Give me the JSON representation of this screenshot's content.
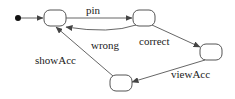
{
  "diagram": {
    "type": "state-machine",
    "initial": {
      "x": 18,
      "y": 18
    },
    "states": [
      {
        "id": "s1",
        "x": 44,
        "y": 10,
        "w": 22,
        "h": 16
      },
      {
        "id": "s2",
        "x": 133,
        "y": 10,
        "w": 22,
        "h": 16
      },
      {
        "id": "s3",
        "x": 200,
        "y": 44,
        "w": 22,
        "h": 16
      },
      {
        "id": "s4",
        "x": 110,
        "y": 75,
        "w": 22,
        "h": 16
      }
    ],
    "transitions": [
      {
        "from": "s1",
        "to": "s2",
        "label": "pin"
      },
      {
        "from": "s2",
        "to": "s1",
        "label": "wrong"
      },
      {
        "from": "s2",
        "to": "s3",
        "label": "correct"
      },
      {
        "from": "s3",
        "to": "s4",
        "label": "viewAcc"
      },
      {
        "from": "s4",
        "to": "s1",
        "label": "showAcc"
      }
    ]
  },
  "labels": {
    "pin": "pin",
    "wrong": "wrong",
    "correct": "correct",
    "viewAcc": "viewAcc",
    "showAcc": "showAcc"
  }
}
